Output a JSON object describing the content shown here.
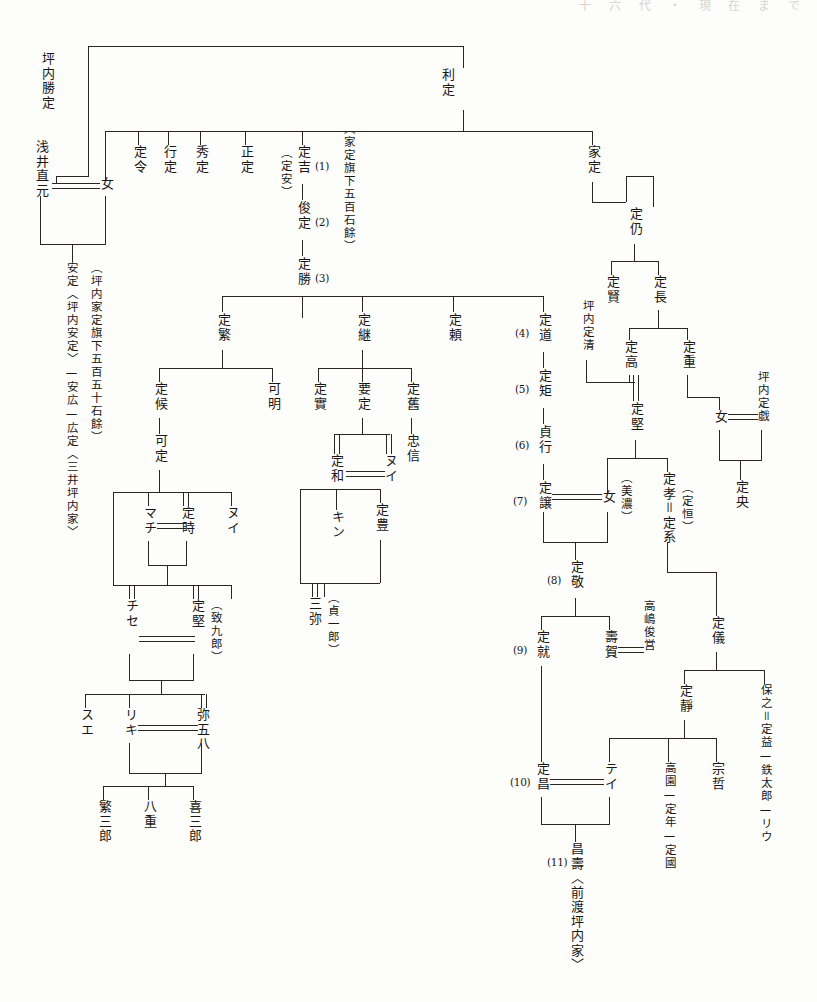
{
  "document": {
    "title": "坪内家系図",
    "top_cut_text": "十 六 代 ・ 現 在 ま で"
  },
  "colors": {
    "ink": "#2a2723",
    "paper": "#fdfdfc",
    "faint": "#d8d5d0"
  },
  "people": {
    "katsusada": "坪内勝定",
    "toshisada": "利定",
    "asai_naomoto": "浅井直元",
    "musume1": "女",
    "yasusada_note": "安定〈坪内安定〉—安広—広定〈三井坪内家〉",
    "tsubouchi_koku": "（坪内家定旗下五百五十石餘）",
    "sadanori": "定令",
    "yukisada": "行定",
    "hidesada": "秀定",
    "masasada": "正定",
    "sadayasu_alt": "（定安）",
    "sadakichi": "定吉",
    "toshisada2": "俊定",
    "sadakatsu": "定勝",
    "iesada_koku": "（家定旗下五百石餘）",
    "iesada": "家定",
    "sadanao": "定仍",
    "sadakata": "定賢",
    "sadanaga": "定長",
    "sadashige_1": "定繁",
    "sadatsugu": "定継",
    "sadayori": "定頼",
    "sadamichi": "定道",
    "sadanori2": "定矩",
    "sadayuki": "貞行",
    "sadayuzuru": "定譲",
    "tsubouchi_sadakiyo": "坪内定清",
    "sadataka": "定高",
    "sadashige_2": "定重",
    "tsubouchi_sadanari": "坪内定戯",
    "musume2": "女",
    "sadakata2": "定堅",
    "mino": "（美濃）",
    "musume3": "女",
    "sadataka2": "定孝＝定系",
    "sadatsune_alt": "（定恒）",
    "sadao": "定央",
    "sadakou": "定候",
    "kasada": "可定",
    "kamei": "可明",
    "sadazane": "定實",
    "yousada": "要定",
    "sadahisa": "定舊",
    "tadanobu": "忠信",
    "machi": "マチ",
    "sadatoki": "定時",
    "nui": "ヌイ",
    "chise": "チセ",
    "sadakata3": "定堅",
    "chikukurou": "（致九郎）",
    "sue": "スエ",
    "riki": "リキ",
    "yagohachi": "弥五八",
    "shigesaburou": "繁三郎",
    "yae": "八重",
    "kisaburou": "喜三郎",
    "sadakazu": "定和",
    "nui2": "ヌイ",
    "kin": "キン",
    "sadatoyo": "定豊",
    "miya": "三弥",
    "teiichirou": "（貞一郎）",
    "sadakazu2": "定敬",
    "sadanari2": "定就",
    "juga": "壽賀",
    "takashima": "高嶋俊営",
    "sadayoshi": "定儀",
    "sadashizu": "定靜",
    "yasushi": "保之＝定益—鉄太郎—リウ",
    "sadamasa": "定昌",
    "tei": "テイ",
    "masaju": "昌壽〈前渡坪内家〉",
    "takasono": "高園—定年—定國",
    "soutetsu": "宗哲"
  },
  "generation_numbers": {
    "n1": "(1)",
    "n2": "(2)",
    "n3": "(3)",
    "n4": "(4)",
    "n5": "(5)",
    "n6": "(6)",
    "n7": "(7)",
    "n8": "(8)",
    "n9": "(9)",
    "n10": "(10)",
    "n11": "(11)"
  }
}
